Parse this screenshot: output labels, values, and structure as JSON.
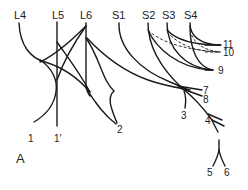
{
  "panel_label": "A",
  "roots": [
    {
      "id": "L4",
      "label": "L4"
    },
    {
      "id": "L5",
      "label": "L5"
    },
    {
      "id": "L6",
      "label": "L6"
    },
    {
      "id": "S1",
      "label": "S1"
    },
    {
      "id": "S2",
      "label": "S2"
    },
    {
      "id": "S3",
      "label": "S3"
    },
    {
      "id": "S4",
      "label": "S4"
    }
  ],
  "branches": [
    {
      "id": "1",
      "label": "1"
    },
    {
      "id": "1p",
      "label": "1′"
    },
    {
      "id": "2",
      "label": "2"
    },
    {
      "id": "3",
      "label": "3"
    },
    {
      "id": "4",
      "label": "4"
    },
    {
      "id": "5",
      "label": "5"
    },
    {
      "id": "6",
      "label": "6"
    },
    {
      "id": "7",
      "label": "7"
    },
    {
      "id": "8",
      "label": "8"
    },
    {
      "id": "9",
      "label": "9"
    },
    {
      "id": "10",
      "label": "10"
    },
    {
      "id": "11",
      "label": "11"
    }
  ],
  "colors": {
    "line": "#1a1a1a",
    "background": "#ffffff"
  }
}
